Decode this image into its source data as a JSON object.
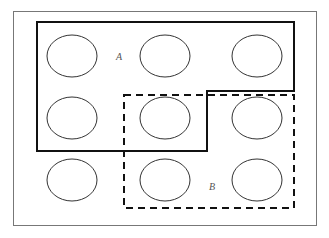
{
  "diagram": {
    "type": "grid-regions",
    "colors": {
      "background": "#ffffff",
      "frame": "#777777",
      "region_a_stroke": "#111111",
      "region_b_stroke": "#111111",
      "ellipse_stroke": "#333333",
      "label": "#555555"
    },
    "frame": {
      "x": 13,
      "y": 11,
      "width": 303,
      "height": 214
    },
    "ellipses": [
      {
        "row": 1,
        "col": 1,
        "cx": 72,
        "cy": 56,
        "rx": 25,
        "ry": 21
      },
      {
        "row": 1,
        "col": 2,
        "cx": 165,
        "cy": 56,
        "rx": 25,
        "ry": 21
      },
      {
        "row": 1,
        "col": 3,
        "cx": 257,
        "cy": 56,
        "rx": 25,
        "ry": 21
      },
      {
        "row": 2,
        "col": 1,
        "cx": 72,
        "cy": 118,
        "rx": 25,
        "ry": 21
      },
      {
        "row": 2,
        "col": 2,
        "cx": 165,
        "cy": 118,
        "rx": 25,
        "ry": 21
      },
      {
        "row": 2,
        "col": 3,
        "cx": 257,
        "cy": 118,
        "rx": 25,
        "ry": 21
      },
      {
        "row": 3,
        "col": 1,
        "cx": 72,
        "cy": 180,
        "rx": 25,
        "ry": 21
      },
      {
        "row": 3,
        "col": 2,
        "cx": 165,
        "cy": 180,
        "rx": 25,
        "ry": 21
      },
      {
        "row": 3,
        "col": 3,
        "cx": 257,
        "cy": 180,
        "rx": 25,
        "ry": 21
      }
    ],
    "regions": [
      {
        "id": "A",
        "label": "A",
        "style": "solid",
        "points": "37,22 294,22 294,91 207,91 207,151 37,151",
        "label_x": 116,
        "label_y": 60
      },
      {
        "id": "B",
        "label": "B",
        "style": "dashed",
        "points": "124,95 294,95 294,208 124,208",
        "label_x": 209,
        "label_y": 190
      }
    ]
  }
}
